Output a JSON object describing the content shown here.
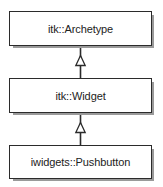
{
  "diagram": {
    "type": "uml-class-inheritance",
    "background_color": "#ffffff",
    "line_color": "#2b2b2b",
    "shadow_color": "#9a9a9a",
    "classes": [
      {
        "id": "archetype",
        "label": "itk::Archetype"
      },
      {
        "id": "widget",
        "label": "itk::Widget"
      },
      {
        "id": "pushbutton",
        "label": "iwidgets::Pushbutton"
      }
    ],
    "relations": [
      {
        "from": "widget",
        "to": "archetype",
        "kind": "generalization",
        "arrow": "hollow-triangle"
      },
      {
        "from": "pushbutton",
        "to": "widget",
        "kind": "generalization",
        "arrow": "hollow-triangle"
      }
    ]
  }
}
